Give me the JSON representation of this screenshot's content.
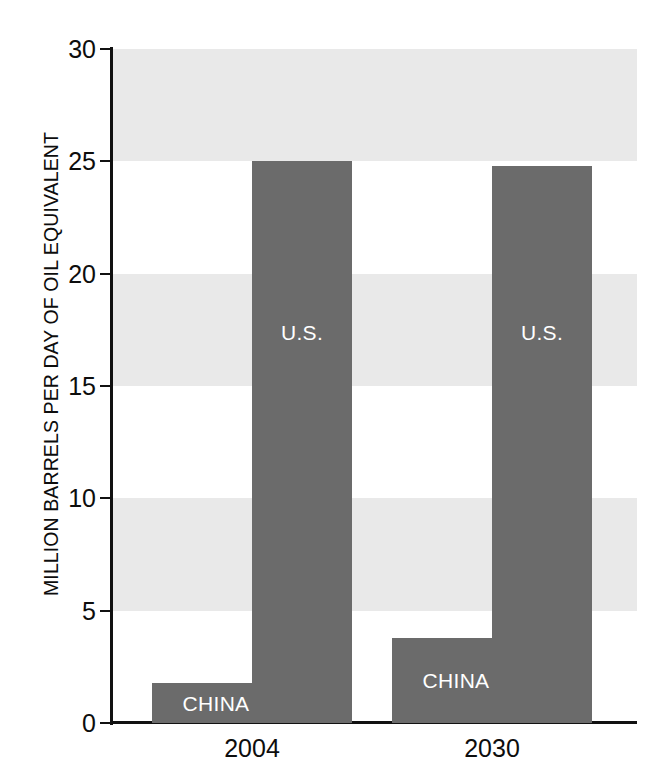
{
  "chart_data": {
    "type": "bar",
    "title": "",
    "subtitle": "",
    "xlabel": "",
    "ylabel": "MILLION BARRELS PER DAY OF OIL EQUIVALENT",
    "ylim": [
      0,
      30
    ],
    "yticks": [
      "0",
      "5",
      "10",
      "15",
      "20",
      "25",
      "30"
    ],
    "ytick_values": [
      0,
      5,
      10,
      15,
      20,
      25,
      30
    ],
    "grid": "alternating horizontal bands, gray on 5-10, 15-20, 25-30",
    "legend_position": "none (labels drawn inside bars)",
    "categories": [
      "2004",
      "2030"
    ],
    "series": [
      {
        "name": "CHINA",
        "values": [
          1.8,
          3.8
        ]
      },
      {
        "name": "U.S.",
        "values": [
          25.0,
          24.8
        ]
      }
    ],
    "bars": [
      {
        "category": "2004",
        "series": "CHINA",
        "value": 1.8,
        "label": "CHINA",
        "label_position": "inside-bottom"
      },
      {
        "category": "2004",
        "series": "U.S.",
        "value": 25.0,
        "label": "U.S.",
        "label_position": "middle"
      },
      {
        "category": "2030",
        "series": "CHINA",
        "value": 3.8,
        "label": "CHINA",
        "label_position": "inside-bottom"
      },
      {
        "category": "2030",
        "series": "U.S.",
        "value": 24.8,
        "label": "U.S.",
        "label_position": "middle"
      }
    ],
    "colors": {
      "bar": "#6b6b6b",
      "band": "#e9e9e9",
      "background": "#ffffff",
      "axis": "#111111",
      "text": "#0d0d0d",
      "bar_label_text": "#ffffff"
    }
  }
}
